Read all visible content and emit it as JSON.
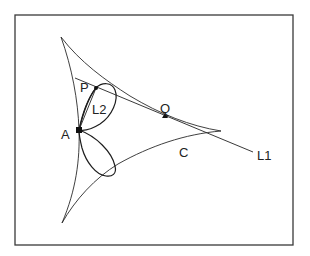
{
  "figure": {
    "frame": {
      "x": 15,
      "y": 15,
      "width": 278,
      "height": 230
    },
    "labels": {
      "P": "P",
      "Q": "Q",
      "A": "A",
      "L1": "L1",
      "L2": "L2",
      "C": "C"
    },
    "points": {
      "A": {
        "x": 79,
        "y": 130
      },
      "P": {
        "x": 96,
        "y": 88
      },
      "Q": {
        "x": 165,
        "y": 116
      }
    },
    "curve_C": {
      "description": "deltoid (three-cusped hypocycloid)",
      "cusps": [
        {
          "x": 61,
          "y": 37
        },
        {
          "x": 221,
          "y": 131
        },
        {
          "x": 62,
          "y": 223
        }
      ]
    },
    "line_L1": {
      "from": {
        "x": 75,
        "y": 78
      },
      "to": {
        "x": 253,
        "y": 152
      }
    },
    "line_L2": {
      "from": {
        "x": 79,
        "y": 130
      },
      "to": {
        "x": 96,
        "y": 88
      }
    },
    "colors": {
      "stroke": "#222222",
      "frame": "#3a3a3a",
      "background": "#ffffff"
    }
  }
}
